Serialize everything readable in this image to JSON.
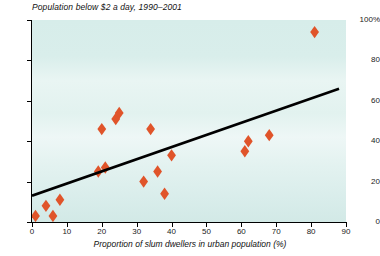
{
  "chart_data": {
    "type": "scatter",
    "title": "Population below $2 a day, 1990–2001",
    "xlabel": "Proportion of slum dwellers in urban population (%)",
    "ylabel": "",
    "xlim": [
      0,
      90
    ],
    "ylim": [
      0,
      100
    ],
    "xticks": [
      "0",
      "10",
      "20",
      "30",
      "40",
      "50",
      "60",
      "70",
      "80",
      "90"
    ],
    "xtick_values": [
      0,
      10,
      20,
      30,
      40,
      50,
      60,
      70,
      80,
      90
    ],
    "yticks": [
      "0",
      "20",
      "40",
      "60",
      "80",
      "100%"
    ],
    "ytick_values": [
      0,
      20,
      40,
      60,
      80,
      100
    ],
    "grid": false,
    "legend": "none",
    "marker": "diamond",
    "marker_color": "#e0542a",
    "points": [
      {
        "x": 1,
        "y": 3
      },
      {
        "x": 4,
        "y": 8
      },
      {
        "x": 6,
        "y": 3
      },
      {
        "x": 8,
        "y": 11
      },
      {
        "x": 19,
        "y": 25
      },
      {
        "x": 20,
        "y": 46
      },
      {
        "x": 21,
        "y": 27
      },
      {
        "x": 24,
        "y": 51
      },
      {
        "x": 25,
        "y": 54
      },
      {
        "x": 32,
        "y": 20
      },
      {
        "x": 34,
        "y": 46
      },
      {
        "x": 36,
        "y": 25
      },
      {
        "x": 38,
        "y": 14
      },
      {
        "x": 40,
        "y": 33
      },
      {
        "x": 61,
        "y": 35
      },
      {
        "x": 62,
        "y": 40
      },
      {
        "x": 68,
        "y": 43
      },
      {
        "x": 81,
        "y": 94
      }
    ],
    "trendline": {
      "color": "#000000",
      "x0": 0,
      "y0": 13,
      "x1": 88,
      "y1": 66
    }
  }
}
